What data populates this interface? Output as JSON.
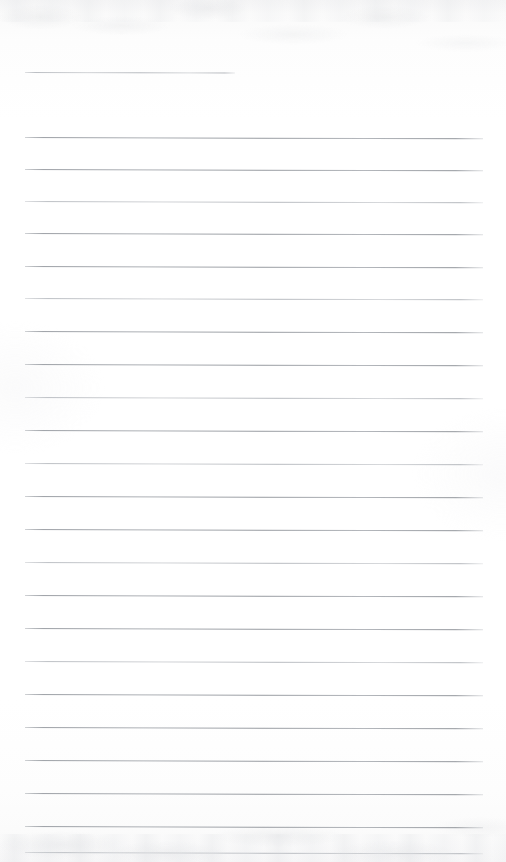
{
  "document": {
    "type": "scanned-lined-paper",
    "title": "Blank lined notebook page",
    "description": "Scanned blank ruled writing paper, no handwriting or printed text present",
    "page_width": 506,
    "page_height": 862,
    "background_color": "#fdfdfd",
    "rule_color": "#9aa0a6",
    "content_text": ""
  },
  "rules": {
    "count": 24,
    "left_margin_x": 25,
    "right_edge_x": 483,
    "first_line_right_edge_x": 235,
    "spacing_px": 32.4,
    "thickness_px": 1,
    "skew_degrees": 0.16,
    "items": [
      {
        "index": 1,
        "y": 72,
        "x": 25,
        "width": 210,
        "style": "soft"
      },
      {
        "index": 2,
        "y": 137,
        "x": 25,
        "width": 458,
        "style": "firm"
      },
      {
        "index": 3,
        "y": 169,
        "x": 25,
        "width": 458,
        "style": "firm"
      },
      {
        "index": 4,
        "y": 201,
        "x": 25,
        "width": 458,
        "style": "soft"
      },
      {
        "index": 5,
        "y": 233,
        "x": 25,
        "width": 458,
        "style": "firm"
      },
      {
        "index": 6,
        "y": 266,
        "x": 25,
        "width": 458,
        "style": "firm"
      },
      {
        "index": 7,
        "y": 298,
        "x": 25,
        "width": 458,
        "style": "soft"
      },
      {
        "index": 8,
        "y": 331,
        "x": 25,
        "width": 458,
        "style": "firm"
      },
      {
        "index": 9,
        "y": 364,
        "x": 25,
        "width": 458,
        "style": "firm"
      },
      {
        "index": 10,
        "y": 397,
        "x": 25,
        "width": 458,
        "style": "soft"
      },
      {
        "index": 11,
        "y": 430,
        "x": 25,
        "width": 458,
        "style": "firm"
      },
      {
        "index": 12,
        "y": 463,
        "x": 25,
        "width": 458,
        "style": "soft"
      },
      {
        "index": 13,
        "y": 496,
        "x": 25,
        "width": 458,
        "style": "firm"
      },
      {
        "index": 14,
        "y": 529,
        "x": 25,
        "width": 458,
        "style": "firm"
      },
      {
        "index": 15,
        "y": 562,
        "x": 25,
        "width": 458,
        "style": "soft"
      },
      {
        "index": 16,
        "y": 595,
        "x": 25,
        "width": 458,
        "style": "firm"
      },
      {
        "index": 17,
        "y": 628,
        "x": 25,
        "width": 458,
        "style": "firm"
      },
      {
        "index": 18,
        "y": 661,
        "x": 25,
        "width": 458,
        "style": "soft"
      },
      {
        "index": 19,
        "y": 694,
        "x": 25,
        "width": 458,
        "style": "firm"
      },
      {
        "index": 20,
        "y": 727,
        "x": 25,
        "width": 458,
        "style": "firm"
      },
      {
        "index": 21,
        "y": 760,
        "x": 25,
        "width": 458,
        "style": "firm"
      },
      {
        "index": 22,
        "y": 793,
        "x": 25,
        "width": 458,
        "style": "firm"
      },
      {
        "index": 23,
        "y": 826,
        "x": 25,
        "width": 458,
        "style": "firm"
      },
      {
        "index": 24,
        "y": 852,
        "x": 25,
        "width": 458,
        "style": "soft"
      }
    ]
  }
}
